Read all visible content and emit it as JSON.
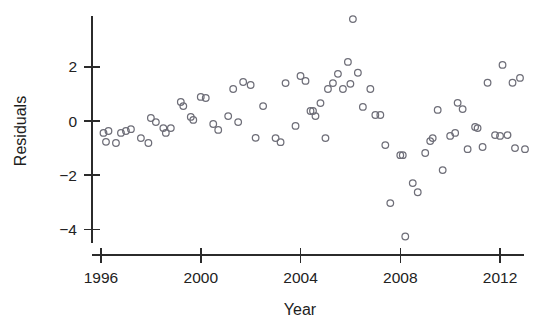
{
  "figure": {
    "kind": "scatter-plot",
    "background_color": "#ffffff",
    "marker_color": "#6e6e78",
    "axis_color": "#2b2b2b",
    "text_color": "#222222"
  },
  "axes": {
    "y_title": "Residuals",
    "x_title": "Year",
    "y_ticks": [
      "2",
      "0",
      "-2",
      "-4"
    ],
    "y_tick_values": [
      2,
      0,
      -2,
      -4
    ],
    "x_ticks": [
      "1996",
      "2000",
      "2004",
      "2008",
      "2012"
    ],
    "x_tick_values": [
      1996,
      2000,
      2004,
      2008,
      2012
    ]
  },
  "chart_data": {
    "type": "scatter",
    "title": "",
    "xlabel": "Year",
    "ylabel": "Residuals",
    "xlim": [
      1995.1,
      2013.4
    ],
    "ylim": [
      -4.9,
      3.9
    ],
    "xticks": [
      1996,
      2000,
      2004,
      2008,
      2012
    ],
    "yticks": [
      -4,
      -2,
      0,
      2
    ],
    "grid": false,
    "legend": null,
    "marker": "open-circle",
    "n_points": 80,
    "points": [
      {
        "x": 1996.1,
        "y": -0.44
      },
      {
        "x": 1996.3,
        "y": -0.37
      },
      {
        "x": 1996.2,
        "y": -0.77
      },
      {
        "x": 1996.6,
        "y": -0.81
      },
      {
        "x": 1996.8,
        "y": -0.44
      },
      {
        "x": 1997.0,
        "y": -0.37
      },
      {
        "x": 1997.2,
        "y": -0.3
      },
      {
        "x": 1997.6,
        "y": -0.63
      },
      {
        "x": 1997.9,
        "y": -0.81
      },
      {
        "x": 1998.0,
        "y": 0.11
      },
      {
        "x": 1998.2,
        "y": -0.04
      },
      {
        "x": 1998.5,
        "y": -0.26
      },
      {
        "x": 1998.6,
        "y": -0.44
      },
      {
        "x": 1998.8,
        "y": -0.26
      },
      {
        "x": 1999.2,
        "y": 0.7
      },
      {
        "x": 1999.3,
        "y": 0.55
      },
      {
        "x": 1999.6,
        "y": 0.15
      },
      {
        "x": 1999.7,
        "y": 0.04
      },
      {
        "x": 2000.0,
        "y": 0.89
      },
      {
        "x": 2000.2,
        "y": 0.85
      },
      {
        "x": 2000.5,
        "y": -0.11
      },
      {
        "x": 2000.7,
        "y": -0.33
      },
      {
        "x": 2001.1,
        "y": 0.18
      },
      {
        "x": 2001.3,
        "y": 1.18
      },
      {
        "x": 2001.5,
        "y": -0.04
      },
      {
        "x": 2001.7,
        "y": 1.44
      },
      {
        "x": 2002.0,
        "y": 1.33
      },
      {
        "x": 2002.2,
        "y": -0.62
      },
      {
        "x": 2002.5,
        "y": 0.55
      },
      {
        "x": 2003.0,
        "y": -0.63
      },
      {
        "x": 2003.2,
        "y": -0.78
      },
      {
        "x": 2003.4,
        "y": 1.4
      },
      {
        "x": 2004.0,
        "y": 1.66
      },
      {
        "x": 2004.2,
        "y": 1.48
      },
      {
        "x": 2004.4,
        "y": 0.37
      },
      {
        "x": 2004.5,
        "y": 0.37
      },
      {
        "x": 2004.6,
        "y": 0.18
      },
      {
        "x": 2004.8,
        "y": 0.66
      },
      {
        "x": 2005.1,
        "y": 1.18
      },
      {
        "x": 2005.3,
        "y": 1.4
      },
      {
        "x": 2005.5,
        "y": 1.74
      },
      {
        "x": 2005.7,
        "y": 1.18
      },
      {
        "x": 2005.9,
        "y": 2.18
      },
      {
        "x": 2006.0,
        "y": 1.37
      },
      {
        "x": 2006.1,
        "y": 3.76
      },
      {
        "x": 2006.3,
        "y": 1.78
      },
      {
        "x": 2006.5,
        "y": 0.52
      },
      {
        "x": 2006.8,
        "y": 1.18
      },
      {
        "x": 2007.0,
        "y": 0.22
      },
      {
        "x": 2007.2,
        "y": 0.22
      },
      {
        "x": 2007.4,
        "y": -0.89
      },
      {
        "x": 2007.6,
        "y": -3.03
      },
      {
        "x": 2008.0,
        "y": -1.26
      },
      {
        "x": 2008.1,
        "y": -1.26
      },
      {
        "x": 2008.2,
        "y": -4.26
      },
      {
        "x": 2008.5,
        "y": -2.29
      },
      {
        "x": 2008.7,
        "y": -2.63
      },
      {
        "x": 2009.0,
        "y": -1.18
      },
      {
        "x": 2009.2,
        "y": -0.74
      },
      {
        "x": 2009.3,
        "y": -0.63
      },
      {
        "x": 2009.5,
        "y": 0.41
      },
      {
        "x": 2009.7,
        "y": -1.81
      },
      {
        "x": 2010.0,
        "y": -0.55
      },
      {
        "x": 2010.2,
        "y": -0.44
      },
      {
        "x": 2010.3,
        "y": 0.67
      },
      {
        "x": 2010.5,
        "y": 0.44
      },
      {
        "x": 2010.7,
        "y": -1.04
      },
      {
        "x": 2011.0,
        "y": -0.22
      },
      {
        "x": 2011.1,
        "y": -0.26
      },
      {
        "x": 2011.3,
        "y": -0.96
      },
      {
        "x": 2011.5,
        "y": 1.41
      },
      {
        "x": 2011.8,
        "y": -0.52
      },
      {
        "x": 2012.0,
        "y": -0.55
      },
      {
        "x": 2012.1,
        "y": 2.07
      },
      {
        "x": 2012.3,
        "y": -0.52
      },
      {
        "x": 2012.5,
        "y": 1.41
      },
      {
        "x": 2012.6,
        "y": -1.0
      },
      {
        "x": 2012.8,
        "y": 1.59
      },
      {
        "x": 2013.0,
        "y": -1.04
      },
      {
        "x": 2005.0,
        "y": -0.63
      },
      {
        "x": 2003.8,
        "y": -0.18
      }
    ]
  }
}
